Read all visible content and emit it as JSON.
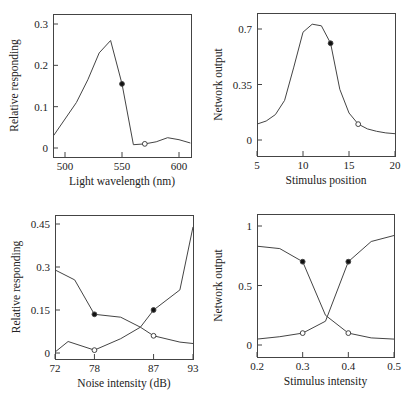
{
  "chart_data": [
    {
      "type": "line",
      "id": "top-left",
      "title": "",
      "xlabel": "Light wavelength (nm)",
      "ylabel": "Relative responding",
      "xlim": [
        490,
        610
      ],
      "ylim": [
        -0.025,
        0.325
      ],
      "xticks": [
        500,
        550,
        600
      ],
      "xtick_labels": [
        "500",
        "550",
        "600"
      ],
      "yticks": [
        0,
        0.1,
        0.2,
        0.3
      ],
      "ytick_labels": [
        "0",
        "0.1",
        "0.2",
        "0.3"
      ],
      "grid": false,
      "series": [
        {
          "name": "response",
          "x": [
            490,
            510,
            520,
            530,
            540,
            550,
            560,
            570,
            580,
            590,
            600,
            610
          ],
          "values": [
            0.03,
            0.11,
            0.165,
            0.23,
            0.26,
            0.155,
            0.008,
            0.01,
            0.015,
            0.025,
            0.02,
            0.012
          ]
        }
      ],
      "markers": [
        {
          "x": 550,
          "y": 0.155,
          "style": "filled"
        },
        {
          "x": 570,
          "y": 0.01,
          "style": "open"
        }
      ]
    },
    {
      "type": "line",
      "id": "top-right",
      "title": "",
      "xlabel": "Stimulus position",
      "ylabel": "Network output",
      "xlim": [
        5,
        20
      ],
      "ylim": [
        -0.1,
        0.78
      ],
      "xticks": [
        5,
        10,
        15,
        20
      ],
      "xtick_labels": [
        "5",
        "10",
        "15",
        "20"
      ],
      "yticks": [
        0,
        0.35,
        0.7
      ],
      "ytick_labels": [
        "0",
        "0.35",
        "0.7"
      ],
      "grid": false,
      "series": [
        {
          "name": "output",
          "x": [
            5,
            6,
            7,
            8,
            9,
            10,
            11,
            12,
            13,
            14,
            15,
            16,
            17,
            18,
            19,
            20
          ],
          "values": [
            0.1,
            0.12,
            0.16,
            0.25,
            0.46,
            0.68,
            0.73,
            0.72,
            0.61,
            0.32,
            0.17,
            0.1,
            0.07,
            0.055,
            0.045,
            0.04
          ]
        }
      ],
      "markers": [
        {
          "x": 13,
          "y": 0.61,
          "style": "filled"
        },
        {
          "x": 16,
          "y": 0.1,
          "style": "open"
        }
      ]
    },
    {
      "type": "line",
      "id": "bottom-left",
      "title": "",
      "xlabel": "Noise intensity (dB)",
      "ylabel": "Relative responding",
      "xlim": [
        72,
        93
      ],
      "ylim": [
        -0.02,
        0.48
      ],
      "xticks": [
        72,
        78,
        87,
        93
      ],
      "xtick_labels": [
        "72",
        "78",
        "87",
        "93"
      ],
      "yticks": [
        0,
        0.15,
        0.3,
        0.45
      ],
      "ytick_labels": [
        "0",
        "0.15",
        "0.3",
        "0.45"
      ],
      "grid": false,
      "series": [
        {
          "name": "decreasing",
          "x": [
            72,
            75,
            78,
            82,
            85,
            87,
            91,
            93
          ],
          "values": [
            0.29,
            0.255,
            0.135,
            0.125,
            0.09,
            0.06,
            0.038,
            0.033
          ]
        },
        {
          "name": "increasing",
          "x": [
            72,
            74,
            78,
            82,
            85,
            87,
            91,
            93
          ],
          "values": [
            0.003,
            0.04,
            0.01,
            0.05,
            0.09,
            0.15,
            0.22,
            0.44
          ]
        }
      ],
      "markers": [
        {
          "x": 78,
          "y": 0.135,
          "style": "filled"
        },
        {
          "x": 87,
          "y": 0.06,
          "style": "open"
        },
        {
          "x": 78,
          "y": 0.01,
          "style": "open"
        },
        {
          "x": 87,
          "y": 0.15,
          "style": "filled"
        }
      ]
    },
    {
      "type": "line",
      "id": "bottom-right",
      "title": "",
      "xlabel": "Stimulus intensity",
      "ylabel": "Network output",
      "xlim": [
        0.2,
        0.5
      ],
      "ylim": [
        -0.1,
        1.1
      ],
      "xticks": [
        0.2,
        0.3,
        0.4,
        0.5
      ],
      "xtick_labels": [
        "0.2",
        "0.3",
        "0.4",
        "0.5"
      ],
      "yticks": [
        0,
        0.5,
        1
      ],
      "ytick_labels": [
        "0",
        "0.5",
        "1"
      ],
      "grid": false,
      "series": [
        {
          "name": "decreasing",
          "x": [
            0.2,
            0.25,
            0.3,
            0.35,
            0.4,
            0.45,
            0.5
          ],
          "values": [
            0.83,
            0.81,
            0.7,
            0.25,
            0.1,
            0.06,
            0.05
          ]
        },
        {
          "name": "increasing",
          "x": [
            0.2,
            0.25,
            0.3,
            0.35,
            0.4,
            0.45,
            0.5
          ],
          "values": [
            0.05,
            0.07,
            0.1,
            0.2,
            0.7,
            0.87,
            0.92
          ]
        }
      ],
      "markers": [
        {
          "x": 0.3,
          "y": 0.7,
          "style": "filled"
        },
        {
          "x": 0.4,
          "y": 0.1,
          "style": "open"
        },
        {
          "x": 0.3,
          "y": 0.1,
          "style": "open"
        },
        {
          "x": 0.4,
          "y": 0.7,
          "style": "filled"
        }
      ]
    }
  ],
  "layout": {
    "panels": [
      {
        "box": [
          53,
          14,
          191,
          157
        ],
        "xpx": [
          65,
          179
        ],
        "xval": [
          500,
          600
        ],
        "ypx": [
          148,
          24
        ],
        "yval": [
          0,
          0.3
        ]
      },
      {
        "box": [
          257,
          13,
          395,
          156
        ],
        "xpx": [
          257,
          395
        ],
        "xval": [
          5,
          20
        ],
        "ypx": [
          140,
          29
        ],
        "yval": [
          0,
          0.7
        ]
      },
      {
        "box": [
          55,
          215,
          193,
          359
        ],
        "xpx": [
          55,
          193
        ],
        "xval": [
          72,
          93
        ],
        "ypx": [
          353,
          224
        ],
        "yval": [
          0,
          0.45
        ]
      },
      {
        "box": [
          257,
          214,
          394,
          357
        ],
        "xpx": [
          257,
          394
        ],
        "xval": [
          0.2,
          0.5
        ],
        "ypx": [
          345,
          226
        ],
        "yval": [
          0,
          1
        ]
      }
    ],
    "line_color": "#444444",
    "text_color": "#222222"
  }
}
